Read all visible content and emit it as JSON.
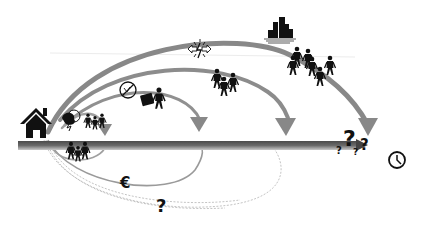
{
  "diagram": {
    "type": "migration-trajectories-over-time",
    "colors": {
      "background": "#ffffff",
      "timeline": "#5a5a5a",
      "arc": "#8a8a8a",
      "arc_light": "#a8a8a8",
      "dashed": "#b5b5b5",
      "icon": "#111111"
    },
    "origin": {
      "icon": "house-icon"
    },
    "timeline": {
      "end_icon": "clock-icon"
    },
    "arcs": [
      {
        "id": "arc-short",
        "label_icon": "family-with-storm-icon"
      },
      {
        "id": "arc-medium",
        "label_icon": "person-with-suitcase-no-crops-icon"
      },
      {
        "id": "arc-long",
        "label_icon": "conflict-group-icon"
      },
      {
        "id": "arc-longest",
        "label_icon": "city-group-icon"
      }
    ],
    "below_line": {
      "loop_icon": "family-group-icon",
      "euro_label": "€",
      "question_label": "?"
    },
    "uncertainty_label": "?",
    "uncertainty_small_labels": [
      "?",
      "?",
      "?"
    ]
  }
}
